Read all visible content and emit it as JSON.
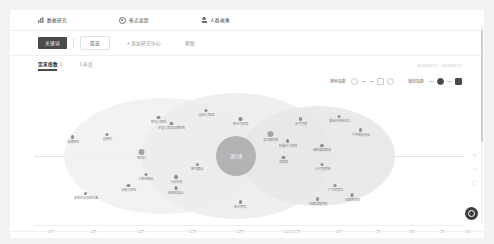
{
  "topnav": {
    "items": [
      {
        "label": "数据研究",
        "icon": "chart-icon"
      },
      {
        "label": "热点追踪",
        "icon": "target-icon"
      },
      {
        "label": "人群画像",
        "icon": "person-icon"
      }
    ]
  },
  "filterbar": {
    "primary_label": "关键词",
    "box_label": "筛选",
    "add_label": "+ 添加研究中心",
    "more_label": "帮助"
  },
  "tabs": {
    "items": [
      {
        "label": "需求指数",
        "sub": "①",
        "active": true
      },
      {
        "label": "1 热度",
        "sub": "",
        "active": false
      }
    ],
    "daterange": "2022/05/17 ~ 2022/07/17"
  },
  "charttools": {
    "group1": {
      "label": "搜索指数",
      "icons": [
        "circle-outline-icon",
        "dash-icon",
        "dash-icon",
        "square-outline-icon",
        "circle-outline-icon"
      ]
    },
    "group2": {
      "label": "媒体指数",
      "icons": [
        "dash-icon",
        "circle-filled-icon",
        "dash-icon",
        "square-filled-icon"
      ]
    }
  },
  "chart_data": {
    "type": "scatter",
    "xlabel": "",
    "ylabel": "",
    "grid": false,
    "legend": "none",
    "axis_ticks": [
      {
        "label": "3月",
        "x": 4
      },
      {
        "label": "4月",
        "x": 14
      },
      {
        "label": "10月",
        "x": 25
      },
      {
        "label": "11月",
        "x": 37
      },
      {
        "label": "12月",
        "x": 48
      },
      {
        "label": "2022年1月",
        "x": 60
      },
      {
        "label": "2月",
        "x": 71
      },
      {
        "label": "3月",
        "x": 80
      },
      {
        "label": "4月",
        "x": 88
      },
      {
        "label": "5月",
        "x": 95
      },
      {
        "label": "6月",
        "x": 101
      }
    ],
    "center_bubble": {
      "label": "流行语",
      "x": 47,
      "y": 50,
      "r": 20
    },
    "rings": [
      {
        "x": 30,
        "y": 50,
        "rx": 23,
        "ry": 42
      },
      {
        "x": 47,
        "y": 50,
        "rx": 22,
        "ry": 46
      },
      {
        "x": 66,
        "y": 50,
        "rx": 18,
        "ry": 36
      }
    ],
    "points": [
      {
        "label": "品牌联名",
        "x": 9,
        "y": 35,
        "size": "sm"
      },
      {
        "label": "国潮化",
        "x": 17,
        "y": 33,
        "size": "sm"
      },
      {
        "label": "联名小家电",
        "x": 29,
        "y": 21,
        "size": "sm"
      },
      {
        "label": "IP定义美妆品牌联名",
        "x": 32,
        "y": 25,
        "size": "sm"
      },
      {
        "label": "国风小家电",
        "x": 40,
        "y": 16,
        "size": "sm"
      },
      {
        "label": "新中式风格",
        "x": 48,
        "y": 22,
        "size": "sm"
      },
      {
        "label": "新风口",
        "x": 25,
        "y": 45,
        "size": "lg"
      },
      {
        "label": "数字藏品",
        "x": 38,
        "y": 55,
        "size": "sm"
      },
      {
        "label": "小家电新品",
        "x": 26,
        "y": 62,
        "size": "sm"
      },
      {
        "label": "冰皮小家电",
        "x": 22,
        "y": 70,
        "size": "sm"
      },
      {
        "label": "定制化冰淇淋礼盒",
        "x": 12,
        "y": 76,
        "size": "sm"
      },
      {
        "label": "几何主题",
        "x": 33,
        "y": 64,
        "size": "sm"
      },
      {
        "label": "新概念食品",
        "x": 33,
        "y": 72,
        "size": "sm"
      },
      {
        "label": "多巴胺穿搭",
        "x": 55,
        "y": 32,
        "size": "lg"
      },
      {
        "label": "轻量化小家电",
        "x": 59,
        "y": 38,
        "size": "sm"
      },
      {
        "label": "预制菜",
        "x": 58,
        "y": 50,
        "size": "sm"
      },
      {
        "label": "元气宅家",
        "x": 62,
        "y": 22,
        "size": "sm"
      },
      {
        "label": "露营经济新风口",
        "x": 71,
        "y": 20,
        "size": "sm"
      },
      {
        "label": "精致露营器具",
        "x": 67,
        "y": 41,
        "size": "sm"
      },
      {
        "label": "户外家居用品",
        "x": 76,
        "y": 30,
        "size": "sm"
      },
      {
        "label": "小户型家电",
        "x": 67,
        "y": 55,
        "size": "sm"
      },
      {
        "label": "广式轻奢风",
        "x": 70,
        "y": 70,
        "size": "sm"
      },
      {
        "label": "低糖低脂烘焙",
        "x": 66,
        "y": 80,
        "size": "sm"
      },
      {
        "label": "无糖茶饮料",
        "x": 74,
        "y": 77,
        "size": "sm"
      },
      {
        "label": "新式茶饮",
        "x": 48,
        "y": 82,
        "size": "sm"
      }
    ]
  },
  "rail": {
    "items": [
      {
        "name": "share-icon",
        "glyph": "⋖"
      },
      {
        "name": "star-icon",
        "glyph": "☆"
      },
      {
        "name": "comment-icon",
        "glyph": "▢"
      }
    ]
  },
  "fab": {
    "name": "record-fab",
    "label": ""
  }
}
